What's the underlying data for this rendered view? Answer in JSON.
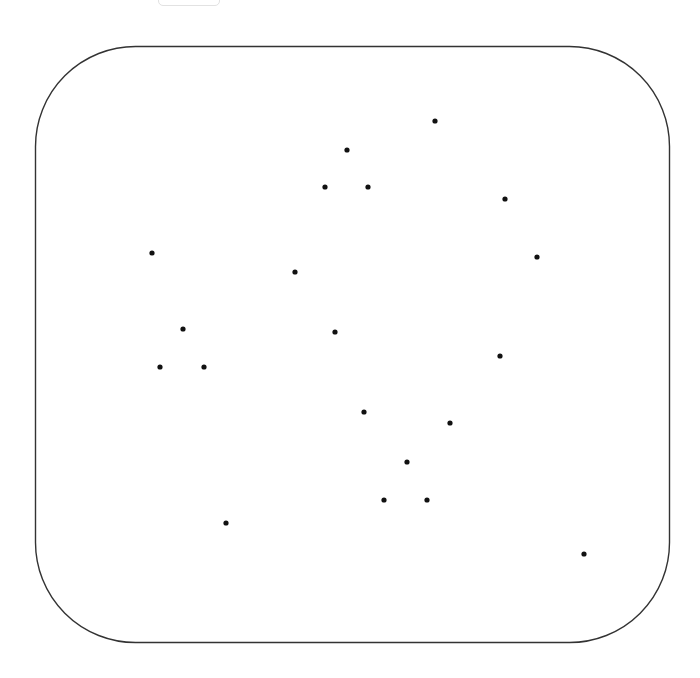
{
  "colors": {
    "background": "#ffffff",
    "frame_stroke": "#333333",
    "dot_fill": "#111111"
  },
  "scene": {
    "shape": "rounded-rectangle",
    "dot_count": 20,
    "dots": [
      {
        "id": 1,
        "x": 435,
        "y": 121
      },
      {
        "id": 2,
        "x": 347,
        "y": 150
      },
      {
        "id": 3,
        "x": 325,
        "y": 187
      },
      {
        "id": 4,
        "x": 368,
        "y": 187
      },
      {
        "id": 5,
        "x": 505,
        "y": 199
      },
      {
        "id": 6,
        "x": 152,
        "y": 253
      },
      {
        "id": 7,
        "x": 537,
        "y": 257
      },
      {
        "id": 8,
        "x": 295,
        "y": 272
      },
      {
        "id": 9,
        "x": 183,
        "y": 329
      },
      {
        "id": 10,
        "x": 335,
        "y": 332
      },
      {
        "id": 11,
        "x": 500,
        "y": 356
      },
      {
        "id": 12,
        "x": 160,
        "y": 367
      },
      {
        "id": 13,
        "x": 204,
        "y": 367
      },
      {
        "id": 14,
        "x": 364,
        "y": 412
      },
      {
        "id": 15,
        "x": 450,
        "y": 423
      },
      {
        "id": 16,
        "x": 407,
        "y": 462
      },
      {
        "id": 17,
        "x": 384,
        "y": 500
      },
      {
        "id": 18,
        "x": 427,
        "y": 500
      },
      {
        "id": 19,
        "x": 226,
        "y": 523
      },
      {
        "id": 20,
        "x": 584,
        "y": 554
      }
    ]
  }
}
